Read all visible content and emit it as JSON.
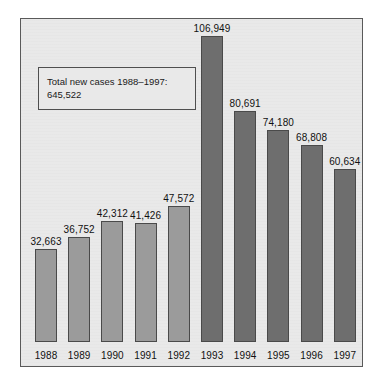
{
  "annotation": {
    "text": "Total new cases 1988–1997:\n645,522"
  },
  "chart_data": {
    "type": "bar",
    "title": "",
    "subtitle": "",
    "xlabel": "",
    "ylabel": "",
    "grid": false,
    "legend": "none",
    "ylim": [
      0,
      106949
    ],
    "categories": [
      "1988",
      "1989",
      "1990",
      "1991",
      "1992",
      "1993",
      "1994",
      "1995",
      "1996",
      "1997"
    ],
    "values": [
      32663,
      36752,
      42312,
      41426,
      47572,
      106949,
      80691,
      74180,
      68808,
      60634
    ],
    "value_labels": [
      "32,663",
      "36,752",
      "42,312",
      "41,426",
      "47,572",
      "106,949",
      "80,691",
      "74,180",
      "68,808",
      "60,634"
    ],
    "bar_tones": [
      "light",
      "light",
      "light",
      "light",
      "light",
      "dark",
      "dark",
      "dark",
      "dark",
      "dark"
    ],
    "annotations": [
      "Total new cases 1988–1997: 645,522"
    ],
    "colors": {
      "bar_light": "#9b9b9b",
      "bar_dark": "#6e6e6e",
      "bar_outline": "#4a4a4a",
      "plot_background": "#e9e9e9",
      "frame_border": "#5a5a5a",
      "text": "#111111",
      "page_background": "#ffffff"
    }
  }
}
